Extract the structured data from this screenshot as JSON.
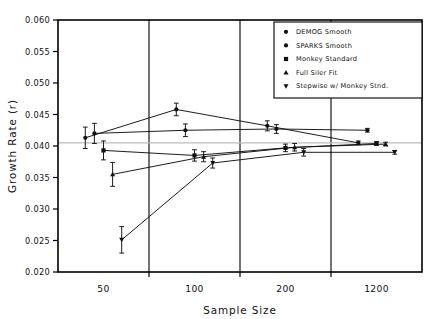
{
  "chart_data": {
    "type": "line",
    "title": "",
    "xlabel": "Sample Size",
    "ylabel": "Growth Rate (r)",
    "ylim": [
      0.02,
      0.06
    ],
    "ytick_labels": [
      "0.060",
      "0.055",
      "0.050",
      "0.045",
      "0.040",
      "0.035",
      "0.030",
      "0.025",
      "0.020"
    ],
    "ytick_values": [
      0.06,
      0.055,
      0.05,
      0.045,
      0.04,
      0.035,
      0.03,
      0.025,
      0.02
    ],
    "categories": [
      "50",
      "100",
      "200",
      "1200"
    ],
    "xtick_labels": [
      "50",
      "100",
      "200",
      "1200"
    ],
    "grid": false,
    "reference_line": 0.0405,
    "legend_position": "top-right",
    "error_bars": true,
    "series": [
      {
        "name": "DEMOG Smooth",
        "marker": "circle",
        "values": [
          0.0413,
          0.0458,
          0.0432,
          0.0405
        ],
        "errors": [
          0.0017,
          0.001,
          0.0008,
          0.0003
        ]
      },
      {
        "name": "SPARKS Smooth",
        "marker": "circle",
        "values": [
          0.042,
          0.0425,
          0.0427,
          0.0425
        ],
        "errors": [
          0.0016,
          0.001,
          0.0007,
          0.0003
        ]
      },
      {
        "name": "Monkey Standard",
        "marker": "square",
        "values": [
          0.0393,
          0.0385,
          0.0397,
          0.0404
        ],
        "errors": [
          0.0015,
          0.0009,
          0.0006,
          0.0003
        ]
      },
      {
        "name": "Full Siler Fit",
        "marker": "triangle",
        "values": [
          0.0355,
          0.0383,
          0.0398,
          0.0403
        ],
        "errors": [
          0.0019,
          0.0008,
          0.0006,
          0.0003
        ]
      },
      {
        "name": "Stepwise w/ Monkey Stnd.",
        "marker": "inv-triangle",
        "values": [
          0.0251,
          0.0373,
          0.039,
          0.039
        ],
        "errors": [
          0.0021,
          0.0008,
          0.0006,
          0.0003
        ]
      }
    ]
  },
  "legend": {
    "entries": [
      {
        "label": "DEMOG Smooth"
      },
      {
        "label": "SPARKS Smooth"
      },
      {
        "label": "Monkey Standard"
      },
      {
        "label": "Full Siler Fit"
      },
      {
        "label": "Stepwise w/ Monkey Stnd."
      }
    ]
  }
}
